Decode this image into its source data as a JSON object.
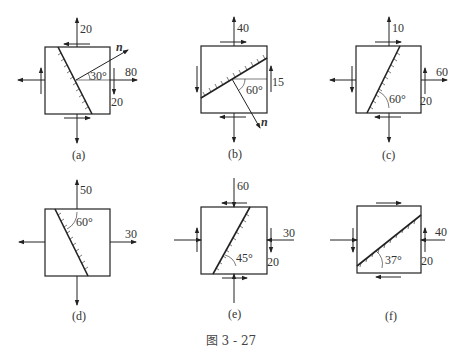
{
  "figure_caption": "图 3 - 27",
  "panels": [
    {
      "id": "a",
      "caption": "(a)",
      "labels": {
        "top": "20",
        "right": "80",
        "shear": "20",
        "angle": "30°",
        "normal": "n"
      }
    },
    {
      "id": "b",
      "caption": "(b)",
      "labels": {
        "top": "40",
        "shear": "15",
        "angle": "60°",
        "normal": "n"
      }
    },
    {
      "id": "c",
      "caption": "(c)",
      "labels": {
        "top": "10",
        "right": "60",
        "shear": "20",
        "angle": "60°"
      }
    },
    {
      "id": "d",
      "caption": "(d)",
      "labels": {
        "top": "50",
        "right": "30",
        "angle": "60°"
      }
    },
    {
      "id": "e",
      "caption": "(e)",
      "labels": {
        "top": "60",
        "right": "30",
        "shear": "20",
        "angle": "45°"
      }
    },
    {
      "id": "f",
      "caption": "(f)",
      "labels": {
        "right": "40",
        "shear": "20",
        "angle": "37°"
      }
    }
  ]
}
